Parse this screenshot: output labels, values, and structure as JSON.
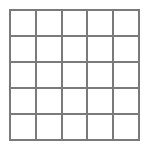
{
  "grid": {
    "rows": 5,
    "columns": 5,
    "line_color": "#7a7a7a",
    "background_color": "#ffffff",
    "cells": [
      [
        "",
        "",
        "",
        "",
        ""
      ],
      [
        "",
        "",
        "",
        "",
        ""
      ],
      [
        "",
        "",
        "",
        "",
        ""
      ],
      [
        "",
        "",
        "",
        "",
        ""
      ],
      [
        "",
        "",
        "",
        "",
        ""
      ]
    ]
  }
}
